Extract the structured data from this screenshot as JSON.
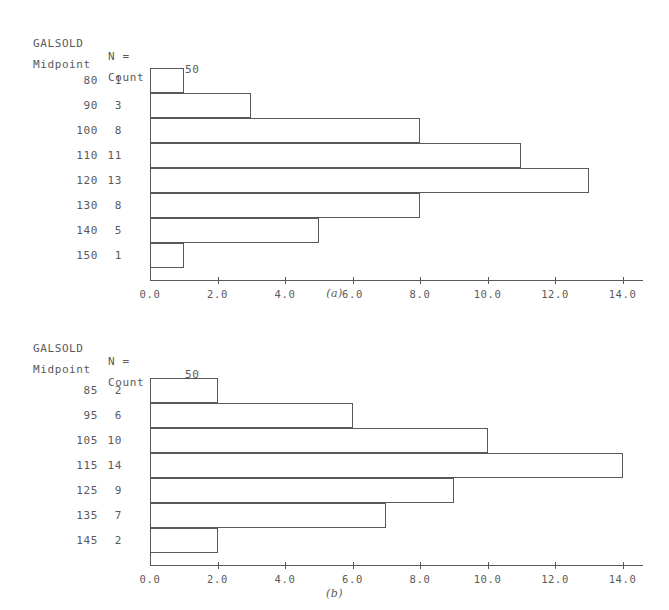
{
  "figures": [
    {
      "id": "a",
      "caption": "(a)",
      "header": {
        "variable": "GALSOLD",
        "n_label": "N =",
        "n_value": "50",
        "midpoint_header": "Midpoint",
        "count_header": "Count"
      },
      "chart_data": {
        "type": "bar",
        "orientation": "horizontal",
        "title": "GALSOLD",
        "xlabel": "",
        "ylabel": "Midpoint",
        "categories": [
          "80",
          "90",
          "100",
          "110",
          "120",
          "130",
          "140",
          "150"
        ],
        "values": [
          1,
          3,
          8,
          11,
          13,
          8,
          5,
          1
        ],
        "xlim": [
          0,
          14
        ],
        "xticks": [
          0,
          2,
          4,
          6,
          8,
          10,
          12,
          14
        ],
        "xtick_labels": [
          "0.0",
          "2.0",
          "4.0",
          "6.0",
          "8.0",
          "10.0",
          "12.0",
          "14.0"
        ],
        "grid": false,
        "legend": false,
        "n": 50
      }
    },
    {
      "id": "b",
      "caption": "(b)",
      "header": {
        "variable": "GALSOLD",
        "n_label": "N =",
        "n_value": "50",
        "midpoint_header": "Midpoint",
        "count_header": "Count"
      },
      "chart_data": {
        "type": "bar",
        "orientation": "horizontal",
        "title": "GALSOLD",
        "xlabel": "",
        "ylabel": "Midpoint",
        "categories": [
          "85",
          "95",
          "105",
          "115",
          "125",
          "135",
          "145"
        ],
        "values": [
          2,
          6,
          10,
          14,
          9,
          7,
          2
        ],
        "xlim": [
          0,
          14
        ],
        "xticks": [
          0,
          2,
          4,
          6,
          8,
          10,
          12,
          14
        ],
        "xtick_labels": [
          "0.0",
          "2.0",
          "4.0",
          "6.0",
          "8.0",
          "10.0",
          "12.0",
          "14.0"
        ],
        "grid": false,
        "legend": false,
        "n": 50
      }
    }
  ],
  "style": {
    "line_color": "#58595b",
    "text_color": "#5a5a5a",
    "background": "#ffffff"
  }
}
